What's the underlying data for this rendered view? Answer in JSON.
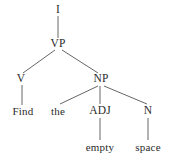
{
  "figure": {
    "kind": "syntax-parse-tree",
    "sentence": "Find the empty space",
    "background_color": "#ffffff",
    "text_color": "#2b2b2b",
    "edge_color": "#555555",
    "width": 172,
    "height": 161
  },
  "nodes": [
    {
      "id": "i",
      "label": "I",
      "type": "category",
      "x": 58,
      "y": 10
    },
    {
      "id": "vp",
      "label": "VP",
      "type": "category",
      "x": 58,
      "y": 44
    },
    {
      "id": "v",
      "label": "V",
      "type": "category",
      "x": 21,
      "y": 79
    },
    {
      "id": "np",
      "label": "NP",
      "type": "category",
      "x": 101,
      "y": 79
    },
    {
      "id": "find",
      "label": "Find",
      "type": "word",
      "x": 23,
      "y": 111
    },
    {
      "id": "the",
      "label": "the",
      "type": "word",
      "x": 58,
      "y": 111
    },
    {
      "id": "adj",
      "label": "ADJ",
      "type": "category",
      "x": 100,
      "y": 111
    },
    {
      "id": "n",
      "label": "N",
      "type": "category",
      "x": 148,
      "y": 111
    },
    {
      "id": "empty",
      "label": "empty",
      "type": "word",
      "x": 100,
      "y": 147
    },
    {
      "id": "space",
      "label": "space",
      "type": "word",
      "x": 148,
      "y": 147
    }
  ],
  "edges": [
    {
      "id": "i-vp",
      "from": "i",
      "to": "vp",
      "x1": 58,
      "y1": 16,
      "x2": 58,
      "y2": 38
    },
    {
      "id": "vp-v",
      "from": "vp",
      "to": "v",
      "x1": 55,
      "y1": 50,
      "x2": 23,
      "y2": 73
    },
    {
      "id": "vp-np",
      "from": "vp",
      "to": "np",
      "x1": 62,
      "y1": 50,
      "x2": 98,
      "y2": 73
    },
    {
      "id": "v-find",
      "from": "v",
      "to": "find",
      "x1": 22,
      "y1": 85,
      "x2": 22,
      "y2": 105
    },
    {
      "id": "np-the",
      "from": "np",
      "to": "the",
      "x1": 98,
      "y1": 86,
      "x2": 60,
      "y2": 104
    },
    {
      "id": "np-adj",
      "from": "np",
      "to": "adj",
      "x1": 100,
      "y1": 86,
      "x2": 100,
      "y2": 104
    },
    {
      "id": "np-n",
      "from": "np",
      "to": "n",
      "x1": 104,
      "y1": 86,
      "x2": 147,
      "y2": 104
    },
    {
      "id": "adj-empty",
      "from": "adj",
      "to": "empty",
      "x1": 100,
      "y1": 118,
      "x2": 100,
      "y2": 140
    },
    {
      "id": "n-space",
      "from": "n",
      "to": "space",
      "x1": 148,
      "y1": 118,
      "x2": 148,
      "y2": 140
    }
  ]
}
